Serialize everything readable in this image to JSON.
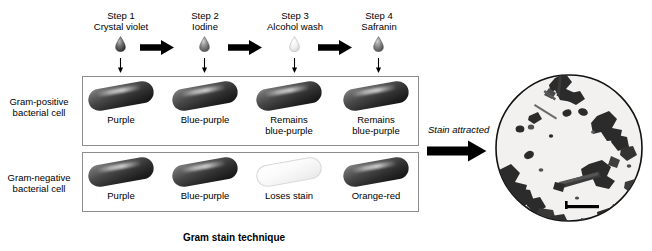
{
  "figure": {
    "caption": "Gram stain technique",
    "top_cropped_text": "",
    "accent_color": "#000000",
    "box_border_color": "#8d8d8d"
  },
  "steps": [
    {
      "number": "Step 1",
      "reagent": "Crystal violet",
      "droplet_icon": "droplet-icon",
      "droplet_shade": "#4a4a4a"
    },
    {
      "number": "Step 2",
      "reagent": "Iodine",
      "droplet_icon": "droplet-icon",
      "droplet_shade": "#6e6e6e"
    },
    {
      "number": "Step 3",
      "reagent": "Alcohol wash",
      "droplet_icon": "droplet-icon",
      "droplet_shade": "#d2d2d2"
    },
    {
      "number": "Step 4",
      "reagent": "Safranin",
      "droplet_icon": "droplet-icon",
      "droplet_shade": "#6e6e6e"
    }
  ],
  "transition_arrows": [
    {
      "icon": "right-arrow-icon"
    },
    {
      "icon": "right-arrow-icon"
    },
    {
      "icon": "right-arrow-icon"
    }
  ],
  "application_arrows": [
    {
      "icon": "down-arrow-icon"
    },
    {
      "icon": "down-arrow-icon"
    },
    {
      "icon": "down-arrow-icon"
    },
    {
      "icon": "down-arrow-icon"
    }
  ],
  "rows": [
    {
      "label_line1": "Gram-positive",
      "label_line2": "bacterial cell",
      "cells": [
        {
          "caption": "Purple",
          "state": "dark"
        },
        {
          "caption": "Blue-purple",
          "state": "dark"
        },
        {
          "caption": "Remains\nblue-purple",
          "state": "dark"
        },
        {
          "caption": "Remains\nblue-purple",
          "state": "dark"
        }
      ]
    },
    {
      "label_line1": "Gram-negative",
      "label_line2": "bacterial cell",
      "cells": [
        {
          "caption": "Purple",
          "state": "dark"
        },
        {
          "caption": "Blue-purple",
          "state": "dark"
        },
        {
          "caption": "Loses stain",
          "state": "pale"
        },
        {
          "caption": "Orange-red",
          "state": "dark"
        }
      ]
    }
  ],
  "result": {
    "label": "Stain attracted",
    "arrow_icon": "right-arrow-icon",
    "micrograph_alt": "micrograph-circle"
  }
}
